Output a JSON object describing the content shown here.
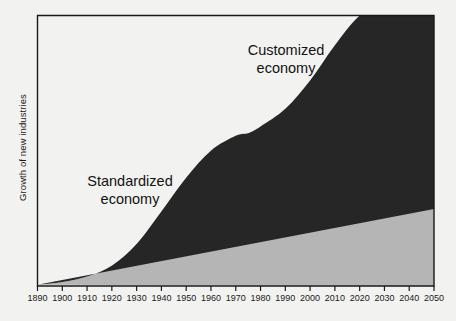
{
  "chart_data": {
    "type": "area",
    "title": "",
    "subtitle": "",
    "xlabel": "",
    "ylabel": "Growth of new industries",
    "grid": false,
    "legend_position": "inline-annotations",
    "xlim": [
      1890,
      2050
    ],
    "ylim": [
      0,
      1
    ],
    "x_tick_labels": [
      "1890",
      "1900",
      "1910",
      "1920",
      "1930",
      "1940",
      "1950",
      "1960",
      "1970",
      "1980",
      "1990",
      "2000",
      "2010",
      "2020",
      "2030",
      "2040",
      "2050"
    ],
    "x": [
      1890,
      1900,
      1910,
      1920,
      1930,
      1940,
      1950,
      1960,
      1970,
      1975,
      1980,
      1990,
      2000,
      2010,
      2020,
      2030,
      2040,
      2050
    ],
    "series": [
      {
        "name": "Standardized economy",
        "color": "#b5b5b5",
        "stack_order": 1,
        "values": [
          0.005,
          0.015,
          0.035,
          0.075,
          0.155,
          0.275,
          0.4,
          0.5,
          0.555,
          0.565,
          0.56,
          0.53,
          0.47,
          0.4,
          0.34,
          0.305,
          0.29,
          0.285
        ],
        "annotation": {
          "text": "Standardized\neconomy",
          "x": 1925,
          "y": 0.7
        }
      },
      {
        "name": "Customized economy",
        "color": "#262626",
        "stack_order": 2,
        "values": [
          0.0,
          0.0,
          0.0,
          0.0,
          0.0,
          0.0,
          0.0,
          0.0,
          0.0,
          0.0,
          0.03,
          0.125,
          0.29,
          0.49,
          0.66,
          0.745,
          0.76,
          0.745
        ],
        "annotation": {
          "text": "Customized\neconomy",
          "x": 2002,
          "y": 0.9
        }
      }
    ],
    "y_axis_ticks_visible": false,
    "axis_color": "#1a1a1a",
    "background_color": "#f2f2f0"
  },
  "annotations": {
    "customized_line1": "Customized",
    "customized_line2": "economy",
    "standardized_line1": "Standardized",
    "standardized_line2": "economy"
  },
  "axes": {
    "y_title": "Growth of new industries"
  }
}
